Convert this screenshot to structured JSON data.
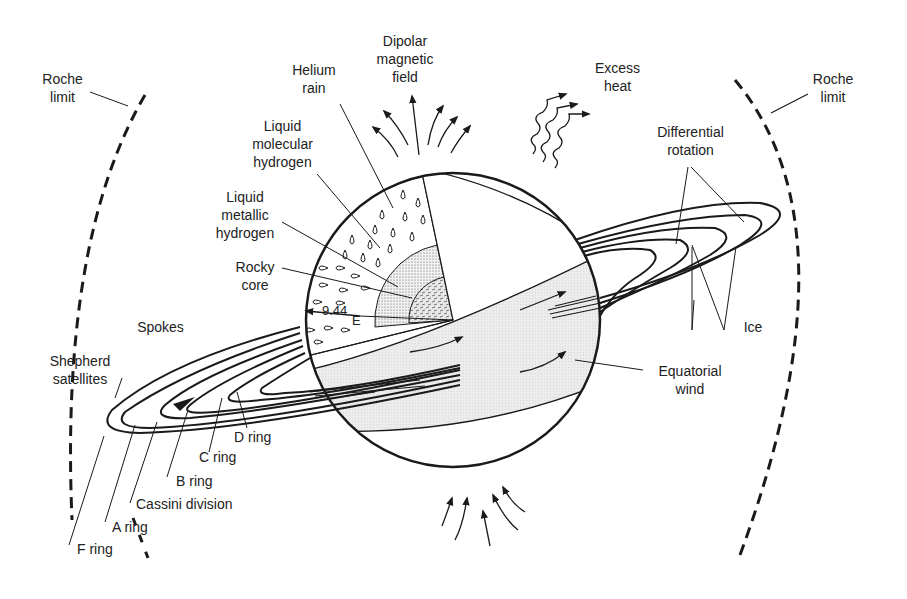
{
  "diagram": {
    "labels": {
      "roche_left": [
        "Roche",
        "limit"
      ],
      "roche_right": [
        "Roche",
        "limit"
      ],
      "helium_rain": [
        "Helium",
        "rain"
      ],
      "dipolar": [
        "Dipolar",
        "magnetic",
        "field"
      ],
      "excess_heat": [
        "Excess",
        "heat"
      ],
      "liquid_molecular": [
        "Liquid",
        "molecular",
        "hydrogen"
      ],
      "liquid_metallic": [
        "Liquid",
        "metallic",
        "hydrogen"
      ],
      "rocky_core": [
        "Rocky",
        "core"
      ],
      "differential_rotation": [
        "Differential",
        "rotation"
      ],
      "ice": "Ice",
      "spokes": "Spokes",
      "shepherd": [
        "Shepherd",
        "satellites"
      ],
      "equatorial_wind": [
        "Equatorial",
        "wind"
      ],
      "d_ring": "D ring",
      "c_ring": "C ring",
      "b_ring": "B ring",
      "cassini": "Cassini division",
      "a_ring": "A ring",
      "f_ring": "F ring",
      "radius_value": "9.44",
      "radius_unit": "E"
    },
    "colors": {
      "ink": "#1a1a1a",
      "band_fill": "#e6e6e6",
      "core_fill": "#d8d8d8",
      "background": "#ffffff"
    }
  }
}
